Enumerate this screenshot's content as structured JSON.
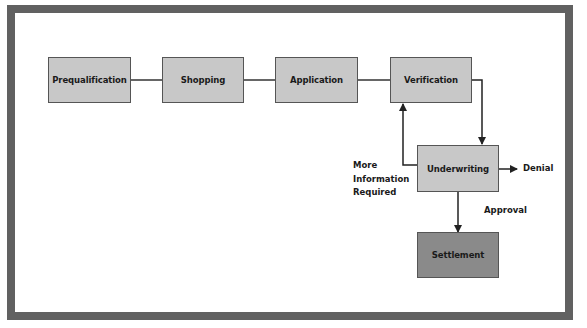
{
  "diagram": {
    "type": "flowchart",
    "colors": {
      "frame": "#616161",
      "box_fill": "#c8c8c8",
      "final_box_fill": "#8a8a8a",
      "line": "#333333"
    },
    "nodes": {
      "prequalification": "Prequalification",
      "shopping": "Shopping",
      "application": "Application",
      "verification": "Verification",
      "underwriting": "Underwriting",
      "settlement": "Settlement"
    },
    "labels": {
      "denial": "Denial",
      "approval": "Approval",
      "more_info_line1": "More",
      "more_info_line2": "Information",
      "more_info_line3": "Required"
    },
    "edges": [
      {
        "from": "Prequalification",
        "to": "Shopping"
      },
      {
        "from": "Shopping",
        "to": "Application"
      },
      {
        "from": "Application",
        "to": "Verification"
      },
      {
        "from": "Verification",
        "to": "Underwriting"
      },
      {
        "from": "Underwriting",
        "to": "Verification",
        "label": "More Information Required"
      },
      {
        "from": "Underwriting",
        "to": "Denial"
      },
      {
        "from": "Underwriting",
        "to": "Settlement",
        "label": "Approval"
      }
    ]
  }
}
